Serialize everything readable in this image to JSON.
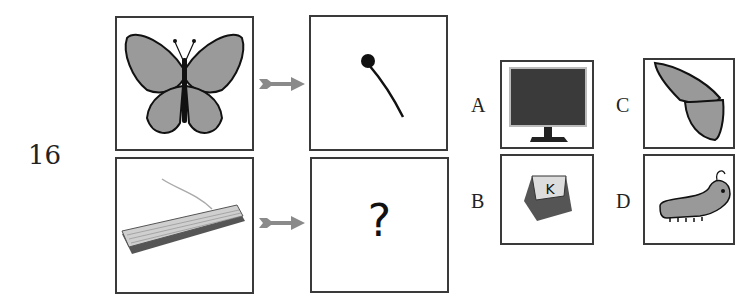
{
  "question": {
    "number": "16",
    "pairs": [
      {
        "source": "butterfly",
        "target": "butterfly-antenna"
      },
      {
        "source": "keyboard",
        "target": "?"
      }
    ],
    "unknown_mark": "?"
  },
  "options": [
    {
      "letter": "A",
      "image": "monitor"
    },
    {
      "letter": "B",
      "image": "keyboard-key",
      "key_label": "K"
    },
    {
      "letter": "C",
      "image": "butterfly-wing"
    },
    {
      "letter": "D",
      "image": "caterpillar"
    }
  ],
  "colors": {
    "border": "#3a3a3a",
    "arrow": "#8a8a8a"
  }
}
